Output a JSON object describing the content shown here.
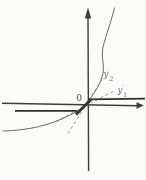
{
  "figure": {
    "origin_label": "0",
    "labels": {
      "slope2": {
        "base": "y",
        "prime": "′",
        "sub": "2"
      },
      "slope1": {
        "base": "y",
        "prime": "′",
        "sub": "1"
      }
    },
    "colors": {
      "axis": "#3d3d3d",
      "curve": "#6a6a6a",
      "thick_curve": "#2f2f2f",
      "dashed": "#8a8a8a",
      "label": "#6e6e6e",
      "origin": "#4a4a4a"
    }
  }
}
